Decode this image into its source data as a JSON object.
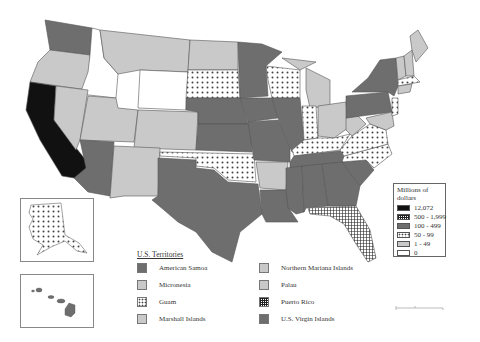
{
  "map": {
    "subject": "United States by state, millions of dollars",
    "colors": {
      "black": "#111111",
      "dark": "#6e6e6e",
      "light": "#c9c9c9",
      "white": "#ffffff",
      "dots": "#444444",
      "grid": "#222222"
    }
  },
  "legend": {
    "title_line1": "Millions of",
    "title_line2": "dollars",
    "items": [
      {
        "label": "12,072",
        "pattern": "solid-black"
      },
      {
        "label": "500 - 1,999",
        "pattern": "crosshatch"
      },
      {
        "label": "100 - 499",
        "pattern": "dark-gray"
      },
      {
        "label": "50 - 99",
        "pattern": "dots"
      },
      {
        "label": "1 - 49",
        "pattern": "light-gray"
      },
      {
        "label": "0",
        "pattern": "white"
      }
    ]
  },
  "territories": {
    "title": "U.S. Territories",
    "items": [
      {
        "label": "American Samoa",
        "pattern": "dark-gray"
      },
      {
        "label": "Northern Mariana Islands",
        "pattern": "light-gray"
      },
      {
        "label": "Micronesia",
        "pattern": "light-gray"
      },
      {
        "label": "Palau",
        "pattern": "light-gray"
      },
      {
        "label": "Guam",
        "pattern": "dots"
      },
      {
        "label": "Puerto Rico",
        "pattern": "crosshatch"
      },
      {
        "label": "Marshall Islands",
        "pattern": "light-gray"
      },
      {
        "label": "U.S. Virgin Islands",
        "pattern": "dark-gray"
      }
    ]
  },
  "insets": {
    "alaska": {
      "pattern": "dots"
    },
    "hawaii": {
      "pattern": "dark-gray"
    }
  }
}
